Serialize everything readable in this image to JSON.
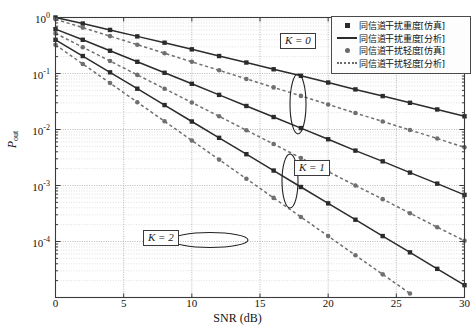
{
  "chart_data": {
    "type": "line",
    "title": "",
    "xlabel": "SNR (dB)",
    "ylabel": "P_out",
    "ylabel_base": "P",
    "ylabel_sub": "out",
    "xlim": [
      0,
      30
    ],
    "ylim": [
      1e-05,
      1
    ],
    "xticks": [
      0,
      5,
      10,
      15,
      20,
      25,
      30
    ],
    "xticklabels": [
      "0",
      "5",
      "10",
      "15",
      "20",
      "25",
      "30"
    ],
    "yticks": [
      1,
      0.1,
      0.01,
      0.001,
      0.0001
    ],
    "yticklabels": [
      "10^0",
      "10^-1",
      "10^-2",
      "10^-3",
      "10^-4"
    ],
    "ytick_mantissa": "10",
    "ytick_exponents": [
      "0",
      "-1",
      "-2",
      "-3",
      "-4"
    ],
    "grid": true,
    "grid_minor": true,
    "yscale": "log",
    "legend_position": "top-right",
    "legend": [
      "同信道干扰重度[仿真]",
      "同信道干扰重度[分析]",
      "同信道干扰轻度[仿真]",
      "同信道干扰轻度[分析]"
    ],
    "legend_styles": [
      "square-marker",
      "solid-line",
      "circle-marker",
      "dashed-line"
    ],
    "annotations": [
      {
        "label": "K = 0",
        "x": 17.0,
        "y": 0.11,
        "ellipse": "vertical"
      },
      {
        "label": "K = 1",
        "x": 20.0,
        "y": 0.0022,
        "ellipse": "vertical"
      },
      {
        "label": "K = 2",
        "x": 11.0,
        "y": 0.00013,
        "ellipse": "horizontal"
      }
    ],
    "x": [
      0,
      2,
      4,
      6,
      8,
      10,
      12,
      14,
      16,
      18,
      20,
      22,
      24,
      26,
      28,
      30
    ],
    "series": [
      {
        "name": "同信道干扰重度[仿真] K=0",
        "group": "heavy",
        "K": 0,
        "style": "solid-square",
        "color": "#2b2b2b",
        "values": [
          1.0,
          0.78,
          0.6,
          0.46,
          0.355,
          0.27,
          0.205,
          0.157,
          0.119,
          0.091,
          0.069,
          0.052,
          0.0395,
          0.03,
          0.0228,
          0.0172
        ]
      },
      {
        "name": "同信道干扰重度[仿真] K=1",
        "group": "heavy",
        "K": 1,
        "style": "solid-square",
        "color": "#2b2b2b",
        "values": [
          0.62,
          0.4,
          0.255,
          0.162,
          0.103,
          0.0655,
          0.0415,
          0.0263,
          0.0167,
          0.0106,
          0.0067,
          0.0042,
          0.0027,
          0.0017,
          0.00108,
          0.00068
        ]
      },
      {
        "name": "同信道干扰重度[仿真] K=2",
        "group": "heavy",
        "K": 2,
        "style": "solid-square",
        "color": "#2b2b2b",
        "values": [
          0.4,
          0.205,
          0.105,
          0.0535,
          0.0273,
          0.0139,
          0.0071,
          0.00362,
          0.00185,
          0.00094,
          0.00048,
          0.000245,
          0.000125,
          6.4e-05,
          3.25e-05,
          1.66e-05
        ]
      },
      {
        "name": "同信道干扰轻度[仿真] K=0",
        "group": "light",
        "K": 0,
        "style": "dashed-circle",
        "color": "#6f6f6f",
        "values": [
          0.93,
          0.66,
          0.465,
          0.327,
          0.23,
          0.162,
          0.114,
          0.08,
          0.0565,
          0.0398,
          0.028,
          0.0197,
          0.0139,
          0.0098,
          0.0069,
          0.0048
        ]
      },
      {
        "name": "同信道干扰轻度[仿真] K=1",
        "group": "light",
        "K": 1,
        "style": "dashed-circle",
        "color": "#6f6f6f",
        "values": [
          0.52,
          0.295,
          0.167,
          0.0945,
          0.0535,
          0.0303,
          0.0172,
          0.0097,
          0.0055,
          0.0031,
          0.00177,
          0.001,
          0.00057,
          0.00032,
          0.00018,
          0.000103
        ]
      },
      {
        "name": "同信道干扰轻度[仿真] K=2",
        "group": "light",
        "K": 2,
        "style": "dashed-circle",
        "color": "#6f6f6f",
        "values": [
          0.325,
          0.148,
          0.0675,
          0.0307,
          0.014,
          0.00637,
          0.0029,
          0.00132,
          0.0006,
          0.000274,
          0.000125,
          5.68e-05,
          2.59e-05,
          1.18e-05,
          5.4e-06,
          2.4e-06
        ]
      }
    ]
  },
  "colors": {
    "heavy": "#2b2b2b",
    "light": "#6f6f6f",
    "axis": "#3a3a3a",
    "grid_major": "#9a9a9a",
    "grid_minor": "#c9c9c9",
    "background": "#ffffff"
  }
}
